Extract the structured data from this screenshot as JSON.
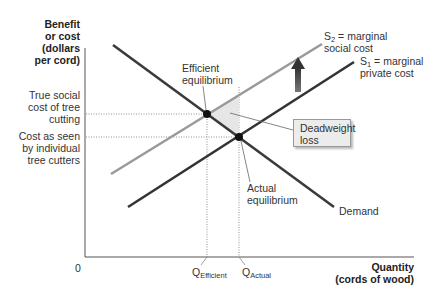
{
  "y_axis": {
    "label_lines": [
      "Benefit",
      "or cost",
      "(dollars",
      "per cord)"
    ]
  },
  "x_axis": {
    "label_lines": [
      "Quantity",
      "(cords of wood)"
    ],
    "origin": "0"
  },
  "price_labels": {
    "true_social_cost": [
      "True social",
      "cost of tree",
      "cutting"
    ],
    "private_cost": [
      "Cost as seen",
      "by individual",
      "tree cutters"
    ]
  },
  "quantity_labels": {
    "efficient": {
      "base": "Q",
      "sub": "Efficient"
    },
    "actual": {
      "base": "Q",
      "sub": "Actual"
    }
  },
  "curves": {
    "s2": {
      "base": "S",
      "sub": "2",
      "text_line1": " = marginal",
      "text_line2": "social cost",
      "color": "#999999"
    },
    "s1": {
      "base": "S",
      "sub": "1",
      "text_line1": " = marginal",
      "text_line2": "private cost",
      "color": "#333333"
    },
    "demand": {
      "label": "Demand",
      "color": "#3a3a3a"
    }
  },
  "annotations": {
    "efficient_eq": [
      "Efficient",
      "equilibrium"
    ],
    "actual_eq": [
      "Actual",
      "equilibrium"
    ],
    "deadweight_loss": [
      "Deadweight",
      "loss"
    ]
  }
}
